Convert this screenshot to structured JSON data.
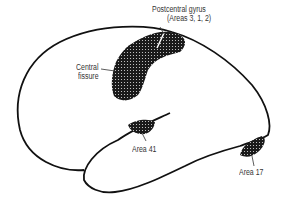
{
  "diagram": {
    "type": "brain-lateral-view",
    "labels": {
      "postcentral_line1": "Postcentral gyrus",
      "postcentral_line2": "(Areas 3, 1, 2)",
      "central_line1": "Central",
      "central_line2": "fissure",
      "area41": "Area 41",
      "area17": "Area 17"
    },
    "colors": {
      "outline": "#111111",
      "stipple_fill": "#1a1a1a",
      "background": "#ffffff",
      "text": "#333333"
    }
  }
}
